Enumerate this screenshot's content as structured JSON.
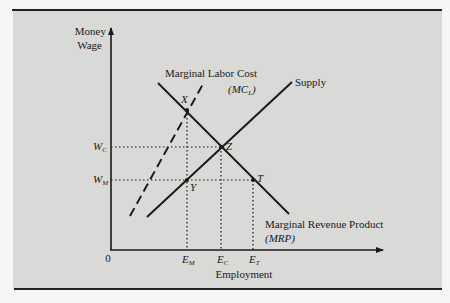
{
  "figure": {
    "axes": {
      "y_label_line1": "Money",
      "y_label_line2": "Wage",
      "x_label": "Employment",
      "origin": "0"
    },
    "curves": {
      "mc": {
        "name": "Marginal Labor Cost",
        "abbr_open": "(",
        "abbr_main": "MC",
        "abbr_sub": "L",
        "abbr_close": ")",
        "style": "dashed"
      },
      "supply": {
        "name": "Supply",
        "style": "solid"
      },
      "mrp": {
        "name": "Marginal Revenue Product",
        "abbr": "(MRP)",
        "style": "solid"
      }
    },
    "points": {
      "x": "X",
      "y": "Y",
      "z": "Z",
      "t": "T"
    },
    "y_ticks": {
      "wc_main": "W",
      "wc_sub": "C",
      "wm_main": "W",
      "wm_sub": "M"
    },
    "x_ticks": {
      "em_main": "E",
      "em_sub": "M",
      "ec_main": "E",
      "ec_sub": "C",
      "et_main": "E",
      "et_sub": "T"
    },
    "colors": {
      "panel": "#d9d9d7",
      "ink": "#1a1a1a",
      "rule": "#222222"
    }
  }
}
